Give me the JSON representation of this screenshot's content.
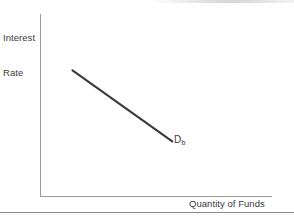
{
  "figure": {
    "background_color": "#ffffff",
    "axis_color": "#9a9a9a",
    "text_color": "#3b3b3b",
    "curve_color": "#3a3a3a"
  },
  "axes": {
    "y_label_line1": "Interest",
    "y_label_line2": "Rate",
    "x_label": "Quantity of Funds"
  },
  "curve": {
    "label_main": "D",
    "label_sub": "b"
  },
  "chart_data": {
    "type": "line",
    "title": "",
    "subtitle": "",
    "xlabel": "Quantity of Funds",
    "ylabel": "Interest Rate",
    "grid": false,
    "legend": null,
    "axis_ticks": {
      "x": [],
      "y": []
    },
    "xlim": [
      0,
      100
    ],
    "ylim": [
      0,
      100
    ],
    "series": [
      {
        "name": "Db",
        "annotation": "D_b",
        "description": "Downward-sloping demand for loanable funds",
        "x": [
          14,
          57
        ],
        "y": [
          69,
          30
        ]
      }
    ]
  }
}
